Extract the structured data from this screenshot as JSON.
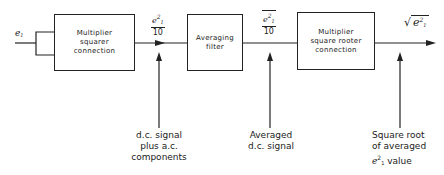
{
  "diagram": {
    "input": {
      "symbol": "e",
      "subscript": "1"
    },
    "blocks": [
      {
        "id": "squarer",
        "label_lines": [
          "Multiplier",
          "squarer",
          "connection"
        ]
      },
      {
        "id": "filter",
        "label_lines": [
          "Averaging",
          "filter"
        ]
      },
      {
        "id": "rooter",
        "label_lines": [
          "Multiplier",
          "square rooter",
          "connection"
        ]
      }
    ],
    "signals": [
      {
        "id": "squared",
        "numerator": "e",
        "numerator_sub": "1",
        "numerator_sup": "2",
        "denominator": "10",
        "overline": false
      },
      {
        "id": "averaged",
        "numerator": "e",
        "numerator_sub": "1",
        "numerator_sup": "2",
        "denominator": "10",
        "overline": true
      },
      {
        "id": "output",
        "expression": "√(e₁²)",
        "symbol": "e",
        "sub": "1",
        "sup": "2"
      }
    ],
    "annotations": [
      {
        "id": "dc-plus-ac",
        "lines": [
          "d.c. signal",
          "plus a.c. components"
        ]
      },
      {
        "id": "averaged-dc",
        "lines": [
          "Averaged",
          "d.c. signal"
        ]
      },
      {
        "id": "sqrt-avg",
        "lines": [
          "Square root",
          "of averaged",
          "e",
          " value"
        ],
        "sup": "2",
        "sub": "1"
      }
    ]
  }
}
